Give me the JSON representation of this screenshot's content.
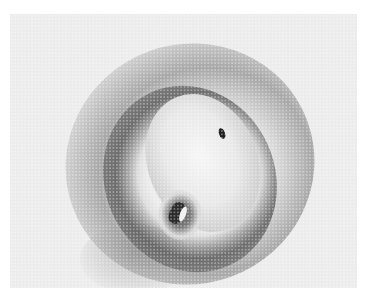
{
  "image": {
    "type": "halftone grayscale photograph",
    "subject": "circular skin lesion with dark surrounding ring, pale center and small crater",
    "colors": {
      "background": "#ececec",
      "ring": "#5a5a5a",
      "center": "#f6f6f6",
      "spot": "#1e1e1e"
    }
  }
}
